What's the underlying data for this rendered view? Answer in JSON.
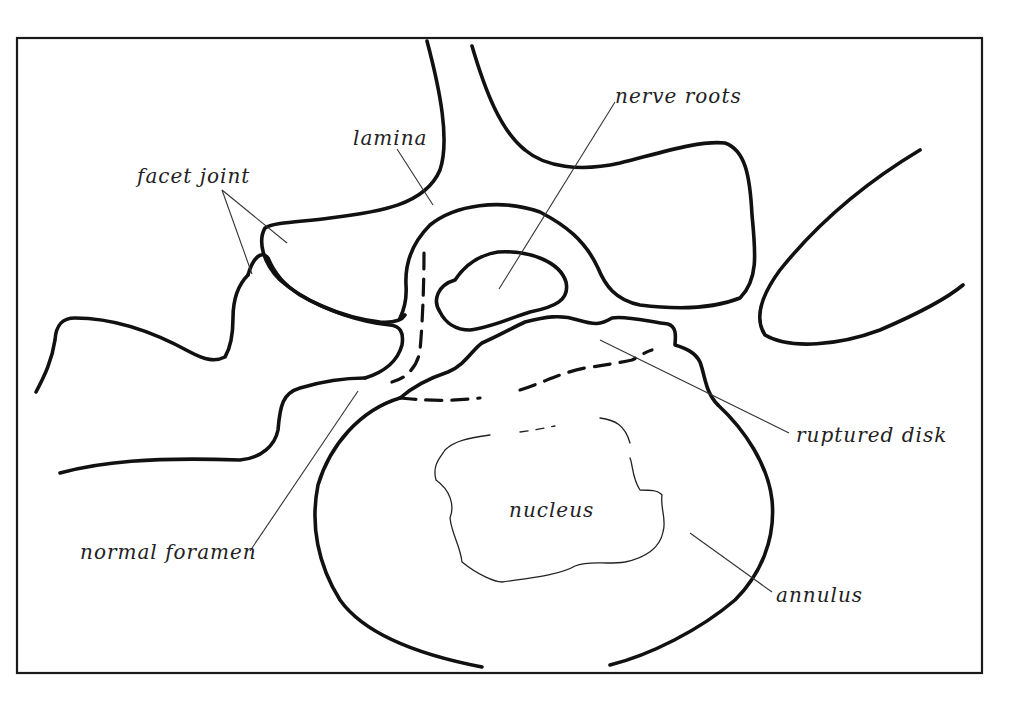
{
  "diagram": {
    "labels": {
      "lamina": "lamina",
      "facet_joint": "facet joint",
      "nerve_roots": "nerve roots",
      "ruptured_disk": "ruptured disk",
      "nucleus": "nucleus",
      "annulus": "annulus",
      "normal_foramen": "normal foramen"
    },
    "colors": {
      "line": "#111111",
      "background": "#ffffff",
      "text": "#222222"
    }
  }
}
